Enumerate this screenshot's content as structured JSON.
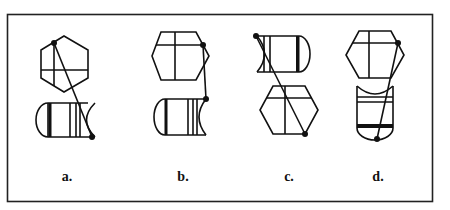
{
  "figure": {
    "type": "multiple-choice-figure-options",
    "background": "#ffffff",
    "stroke_color": "#111111",
    "options": [
      {
        "id": "a",
        "label": "a.",
        "layout": "hexagon-above-barrel",
        "hexagon_orientation": "pointy-top",
        "barrel_orientation": "horizontal-round-left"
      },
      {
        "id": "b",
        "label": "b.",
        "layout": "hexagon-above-barrel",
        "hexagon_orientation": "flat-top",
        "barrel_orientation": "horizontal-round-left"
      },
      {
        "id": "c",
        "label": "c.",
        "layout": "barrel-above-hexagon",
        "hexagon_orientation": "flat-top",
        "barrel_orientation": "horizontal-round-right"
      },
      {
        "id": "d",
        "label": "d.",
        "layout": "hexagon-above-barrel",
        "hexagon_orientation": "flat-top",
        "barrel_orientation": "vertical-round-bottom"
      }
    ]
  }
}
